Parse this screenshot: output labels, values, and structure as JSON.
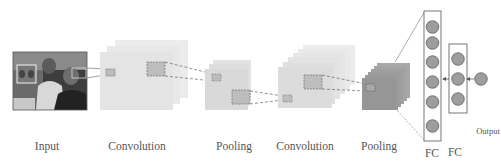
{
  "diagram": {
    "labels": {
      "input": "Input",
      "conv1": "Convolution",
      "pool1": "Pooling",
      "conv2": "Convolution",
      "pool2": "Pooling",
      "fc1": "FC",
      "fc2": "FC",
      "output": "Output"
    },
    "nodes": [
      {
        "id": "input",
        "type": "image",
        "content": "photo of people with face detection box"
      },
      {
        "id": "conv1",
        "type": "feature-map-stack",
        "sheets": 3
      },
      {
        "id": "pool1",
        "type": "feature-map-stack",
        "sheets": 3
      },
      {
        "id": "conv2",
        "type": "feature-map-stack",
        "sheets": 6
      },
      {
        "id": "pool2",
        "type": "feature-map-stack",
        "sheets": 6
      },
      {
        "id": "fc1",
        "type": "fully-connected",
        "neurons": 6
      },
      {
        "id": "fc2",
        "type": "fully-connected",
        "neurons": 3
      },
      {
        "id": "output",
        "type": "output-neuron",
        "neurons": 1
      }
    ],
    "edges": [
      {
        "from": "input",
        "to": "conv1",
        "style": "solid"
      },
      {
        "from": "conv1",
        "to": "pool1",
        "style": "dashed"
      },
      {
        "from": "pool1",
        "to": "conv2",
        "style": "dashed"
      },
      {
        "from": "conv2",
        "to": "pool2",
        "style": "dashed"
      },
      {
        "from": "pool2",
        "to": "fc1",
        "style": "solid/dashed"
      },
      {
        "from": "fc1",
        "to": "fc2",
        "style": "arrow"
      },
      {
        "from": "fc2",
        "to": "output",
        "style": "arrow"
      }
    ],
    "colors": {
      "conv_sheet": "#e6e6e6",
      "pool1_sheet": "#dadada",
      "conv2_sheet": "#dcdcdc",
      "pool2_sheet": "#9a9a9a",
      "patch": "#b9b9b9",
      "neuron": "#9b9b9b",
      "stroke": "#555555",
      "label": "#555555"
    }
  }
}
